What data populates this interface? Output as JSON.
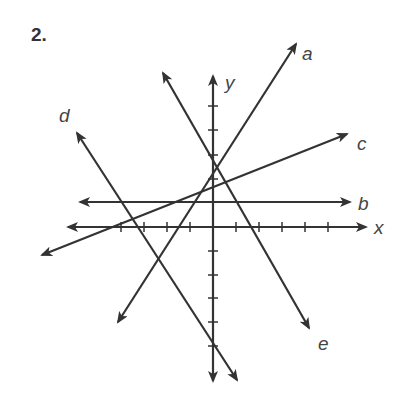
{
  "problem": {
    "number": "2."
  },
  "colors": {
    "line": "#333333",
    "label": "#444444",
    "background": "#ffffff"
  },
  "axes": {
    "x_label": "x",
    "y_label": "y",
    "origin_px": [
      213,
      227
    ],
    "tick_spacing_px": 23,
    "x_ticks": [
      -4,
      -3,
      -2,
      -1,
      1,
      2,
      3,
      4,
      5
    ],
    "y_ticks": [
      -6,
      -5,
      -4,
      -3,
      -2,
      -1,
      1,
      2,
      3,
      4
    ]
  },
  "lines": [
    {
      "name": "a",
      "label": "a",
      "from": [
        118,
        322
      ],
      "to": [
        296,
        44
      ],
      "arrows": "both"
    },
    {
      "name": "b",
      "label": "b",
      "from": [
        80,
        202
      ],
      "to": [
        350,
        202
      ],
      "arrows": "both"
    },
    {
      "name": "c",
      "label": "c",
      "from": [
        42,
        255
      ],
      "to": [
        347,
        134
      ],
      "arrows": "both"
    },
    {
      "name": "d",
      "label": "d",
      "from": [
        77,
        133
      ],
      "to": [
        237,
        380
      ],
      "arrows": "both"
    },
    {
      "name": "e",
      "label": "e",
      "from": [
        163,
        73
      ],
      "to": [
        309,
        328
      ],
      "arrows": "both"
    }
  ]
}
